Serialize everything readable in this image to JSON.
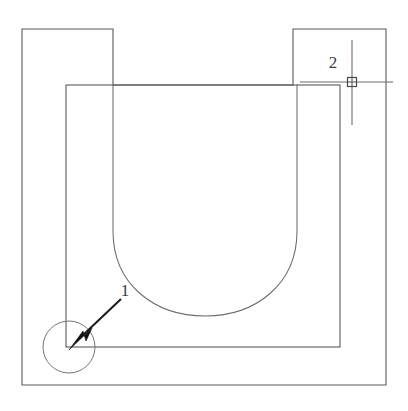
{
  "drawing": {
    "title": "CAD technical drawing",
    "background_color": "#ffffff",
    "line_color": "#5a5a5a",
    "accent_color": "#111111",
    "canvas": {
      "width": 408,
      "height": 411
    },
    "callouts": [
      {
        "id": "1",
        "label": "1",
        "label_x": 125,
        "label_y": 296,
        "kind": "leader-arrow-with-circle",
        "circle": {
          "cx": 69,
          "cy": 347,
          "r": 26
        },
        "leader": {
          "x1": 121,
          "y1": 299,
          "x2": 74,
          "y2": 344
        },
        "arrow_tip": {
          "x": 69,
          "y": 349
        }
      },
      {
        "id": "2",
        "label": "2",
        "label_x": 333,
        "label_y": 68,
        "kind": "crosshair-point-marker",
        "marker": {
          "cx": 352,
          "cy": 82,
          "size": 9
        },
        "crosshair": {
          "h_x1": 300,
          "h_x2": 393,
          "h_y": 82,
          "v_y1": 40,
          "v_y2": 125,
          "v_x": 352
        }
      }
    ],
    "geometry": {
      "outer_profile_label": "outer-plate-outline",
      "outer_profile_points": "22,29 113,29 113,85 293,85 293,29 386,29 386,385 22,385 22,29",
      "inner_rect_label": "inner-pocket-rect",
      "inner_rect": {
        "x": 66,
        "y": 85,
        "width": 274,
        "height": 262
      },
      "u_slot_label": "u-shaped-slot",
      "u_slot_path": "M113,85 L113,231 C113,285 155,316 205,316 C255,316 297,285 297,231 L297,85"
    }
  }
}
